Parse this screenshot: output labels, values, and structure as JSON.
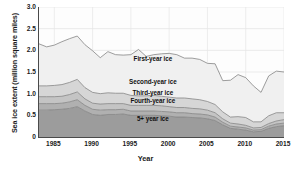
{
  "chart_data": {
    "type": "area",
    "stacked": true,
    "title": "",
    "xlabel": "Year",
    "ylabel": "Sea ice extent (million square miles)",
    "xlim": [
      1983,
      2015
    ],
    "ylim": [
      0,
      3.0
    ],
    "xticks": [
      1985,
      1990,
      1995,
      2000,
      2005,
      2010,
      2015
    ],
    "yticks": [
      "0",
      "0.5",
      "1.0",
      "1.5",
      "2.0",
      "2.5",
      "3.0"
    ],
    "ytick_values": [
      0,
      0.5,
      1.0,
      1.5,
      2.0,
      2.5,
      3.0
    ],
    "grid": "both-faint",
    "legend_position": "inline-band-labels",
    "x": [
      1983,
      1984,
      1985,
      1986,
      1987,
      1988,
      1989,
      1990,
      1991,
      1992,
      1993,
      1994,
      1995,
      1996,
      1997,
      1998,
      1999,
      2000,
      2001,
      2002,
      2003,
      2004,
      2005,
      2006,
      2007,
      2008,
      2009,
      2010,
      2011,
      2012,
      2013,
      2014,
      2015
    ],
    "series": [
      {
        "name": "5+ year ice",
        "order": 1,
        "color": "#9c9c9c",
        "values": [
          0.62,
          0.62,
          0.63,
          0.64,
          0.66,
          0.7,
          0.6,
          0.52,
          0.5,
          0.52,
          0.52,
          0.53,
          0.5,
          0.5,
          0.5,
          0.5,
          0.49,
          0.48,
          0.46,
          0.46,
          0.45,
          0.44,
          0.42,
          0.38,
          0.28,
          0.2,
          0.18,
          0.16,
          0.12,
          0.13,
          0.2,
          0.24,
          0.26
        ]
      },
      {
        "name": "Fourth-year ice",
        "order": 2,
        "color": "#b0b0b0",
        "values": [
          0.15,
          0.15,
          0.14,
          0.14,
          0.15,
          0.16,
          0.13,
          0.12,
          0.12,
          0.11,
          0.11,
          0.11,
          0.1,
          0.1,
          0.1,
          0.1,
          0.1,
          0.1,
          0.1,
          0.1,
          0.09,
          0.09,
          0.09,
          0.08,
          0.06,
          0.05,
          0.05,
          0.05,
          0.04,
          0.04,
          0.05,
          0.06,
          0.06
        ]
      },
      {
        "name": "Third-year ice",
        "order": 3,
        "color": "#c4c4c4",
        "values": [
          0.16,
          0.16,
          0.16,
          0.16,
          0.17,
          0.18,
          0.15,
          0.14,
          0.14,
          0.14,
          0.14,
          0.13,
          0.13,
          0.13,
          0.13,
          0.13,
          0.13,
          0.12,
          0.12,
          0.12,
          0.12,
          0.12,
          0.11,
          0.1,
          0.08,
          0.07,
          0.07,
          0.06,
          0.05,
          0.05,
          0.06,
          0.07,
          0.08
        ]
      },
      {
        "name": "Second-year ice",
        "order": 4,
        "color": "#d6d6d6",
        "values": [
          0.25,
          0.25,
          0.26,
          0.27,
          0.28,
          0.29,
          0.26,
          0.25,
          0.24,
          0.25,
          0.24,
          0.24,
          0.23,
          0.22,
          0.22,
          0.23,
          0.22,
          0.22,
          0.22,
          0.22,
          0.22,
          0.21,
          0.2,
          0.19,
          0.16,
          0.14,
          0.17,
          0.18,
          0.14,
          0.13,
          0.18,
          0.19,
          0.16
        ]
      },
      {
        "name": "First-year ice",
        "order": 5,
        "color": "#f0f0f0",
        "values": [
          0.97,
          0.9,
          0.93,
          0.99,
          1.01,
          1.0,
          0.99,
          0.96,
          0.83,
          0.95,
          0.89,
          0.88,
          0.94,
          1.07,
          0.91,
          0.94,
          0.98,
          1.01,
          1.0,
          0.92,
          0.94,
          0.93,
          0.88,
          0.94,
          0.72,
          0.85,
          0.97,
          0.92,
          0.83,
          0.68,
          0.92,
          0.96,
          0.94
        ]
      }
    ],
    "totals": [
      2.15,
      2.08,
      2.12,
      2.2,
      2.27,
      2.33,
      2.13,
      1.99,
      1.83,
      1.97,
      1.9,
      1.89,
      1.9,
      2.02,
      1.86,
      1.9,
      1.92,
      1.93,
      1.9,
      1.82,
      1.82,
      1.79,
      1.7,
      1.69,
      1.3,
      1.31,
      1.44,
      1.37,
      1.18,
      1.03,
      1.41,
      1.52,
      1.5
    ]
  },
  "band_labels": [
    {
      "text": "First-year ice",
      "x_year": 1998,
      "y_value": 1.8
    },
    {
      "text": "Second-year ice",
      "x_year": 1998,
      "y_value": 1.27
    },
    {
      "text": "Third-year ice",
      "x_year": 1998,
      "y_value": 1.02
    },
    {
      "text": "Fourth-year ice",
      "x_year": 1998,
      "y_value": 0.82
    },
    {
      "text": "5+ year ice",
      "x_year": 1998,
      "y_value": 0.42
    }
  ]
}
